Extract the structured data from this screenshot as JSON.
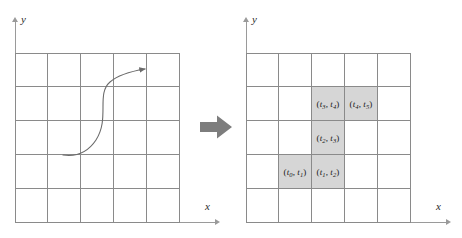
{
  "figure": {
    "panels": {
      "left": {
        "name": "parametric-curve-panel",
        "axis": {
          "x_label": "x",
          "y_label": "y"
        },
        "grid": {
          "columns": 5,
          "rows": 5
        },
        "curve": {
          "shape": "s-curve",
          "has_arrowhead": true,
          "arrow_end": "upper-right",
          "color": "#6b6b6b"
        }
      },
      "right": {
        "name": "rasterized-cells-panel",
        "axis": {
          "x_label": "x",
          "y_label": "y"
        },
        "grid": {
          "columns": 5,
          "rows": 5
        },
        "shaded_color": "#d6d6d6",
        "cells": [
          {
            "row": 2,
            "col": 3,
            "shaded": true,
            "label_t_start": "0",
            "label_t_end": "1",
            "label": "(t3, t4)",
            "t_start": "3",
            "t_end": "4"
          },
          {
            "row": 2,
            "col": 4,
            "shaded": true,
            "t_start": "4",
            "t_end": "5"
          },
          {
            "row": 3,
            "col": 3,
            "shaded": true,
            "t_start": "2",
            "t_end": "3"
          },
          {
            "row": 4,
            "col": 2,
            "shaded": true,
            "t_start": "0",
            "t_end": "1"
          },
          {
            "row": 4,
            "col": 3,
            "shaded": true,
            "t_start": "1",
            "t_end": "2"
          }
        ],
        "labels": {
          "cell_r2c3": {
            "var": "t",
            "sub_start": "3",
            "sub_end": "4"
          },
          "cell_r2c4": {
            "var": "t",
            "sub_start": "4",
            "sub_end": "5"
          },
          "cell_r3c3": {
            "var": "t",
            "sub_start": "2",
            "sub_end": "3"
          },
          "cell_r4c2": {
            "var": "t",
            "sub_start": "0",
            "sub_end": "1"
          },
          "cell_r4c3": {
            "var": "t",
            "sub_start": "1",
            "sub_end": "2"
          }
        }
      }
    },
    "arrow": {
      "name": "transform-arrow",
      "direction": "right",
      "color": "#7d7d7d"
    },
    "punctuation": {
      "open_paren": "(",
      "comma": ",",
      "close_paren": ")"
    }
  }
}
